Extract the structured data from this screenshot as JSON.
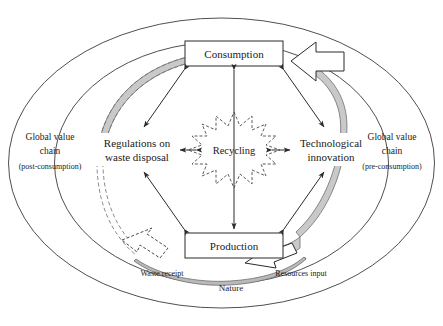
{
  "diagram": {
    "type": "cycle-diagram"
  },
  "nodes": {
    "consumption": {
      "label": "Consumption"
    },
    "production": {
      "label": "Production"
    },
    "regulations": {
      "line1": "Regulations on",
      "line2": "waste disposal"
    },
    "technological": {
      "line1": "Technological",
      "line2": "innovation"
    },
    "recycling": {
      "label": "Recycling"
    }
  },
  "rings": {
    "left": {
      "line1": "Global value",
      "line2": "chain",
      "line3": "(post-consumption)"
    },
    "right": {
      "line1": "Global value",
      "line2": "chain",
      "line3": "(pre-consumption)"
    }
  },
  "flows": {
    "waste_receipt": "Waste receipt",
    "resources_input": "Resources input",
    "nature": "Nature"
  },
  "colors": {
    "band_fill": "#c9c9c9",
    "outline": "#3b3b3b",
    "text": "#1a1a1a",
    "background": "#ffffff"
  }
}
